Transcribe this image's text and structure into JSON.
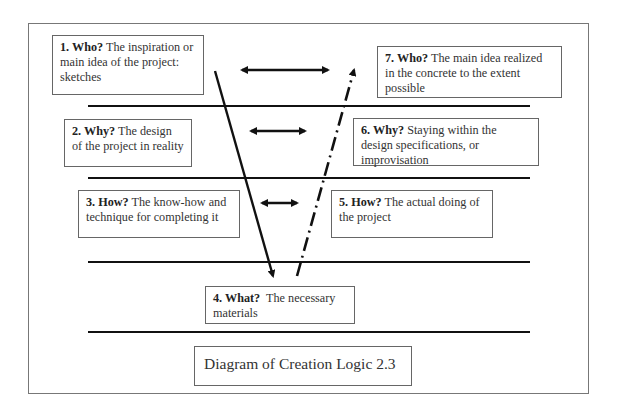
{
  "diagram": {
    "title": "Diagram of Creation Logic 2.3",
    "steps": [
      {
        "num": "1. Who?",
        "text": " The inspiration or main idea of the project: sketches"
      },
      {
        "num": "2. Why?",
        "text": " The design of the project in reality"
      },
      {
        "num": "3. How?",
        "text": " The know-how and technique for completing it"
      },
      {
        "num": "4. What?",
        "text": "  The necessary materials"
      },
      {
        "num": "5. How?",
        "text": " The actual doing of the project"
      },
      {
        "num": "6. Why?",
        "text": " Staying within the design specifications, or improvisation"
      },
      {
        "num": "7. Who?",
        "text": " The main idea realized in the concrete to the extent possible"
      }
    ],
    "connectors": {
      "descending_line": "solid arrow from step 1 down to step 4",
      "ascending_line": "dash-dot arrow from step 4 up to step 7",
      "pair_arrows": [
        "1 <-> 7",
        "2 <-> 6",
        "3 <-> 5"
      ]
    },
    "colors": {
      "line": "#111111",
      "border": "#666666",
      "text": "#333333"
    }
  }
}
